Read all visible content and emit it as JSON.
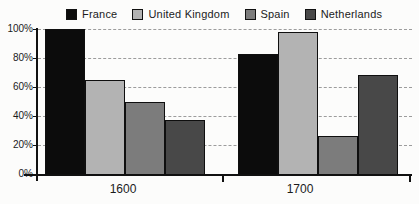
{
  "chart_data": {
    "type": "bar",
    "title": "",
    "xlabel": "",
    "ylabel": "",
    "categories": [
      "1600",
      "1700"
    ],
    "series": [
      {
        "name": "France",
        "color": "#0c0c0c",
        "values": [
          100,
          83
        ]
      },
      {
        "name": "United Kingdom",
        "color": "#b3b3b3",
        "values": [
          65,
          98
        ]
      },
      {
        "name": "Spain",
        "color": "#7c7c7c",
        "values": [
          50,
          26
        ]
      },
      {
        "name": "Netherlands",
        "color": "#484848",
        "values": [
          37,
          68
        ]
      }
    ],
    "ylim": [
      0,
      100
    ],
    "yticks": [
      {
        "value": 0,
        "label": "0%"
      },
      {
        "value": 20,
        "label": "20%"
      },
      {
        "value": 40,
        "label": "40%"
      },
      {
        "value": 60,
        "label": "60%"
      },
      {
        "value": 80,
        "label": "80%"
      },
      {
        "value": 100,
        "label": "100%"
      }
    ],
    "grid": "horizontal-dashed",
    "legend_position": "top"
  },
  "colors": {
    "background": "#fcfcfb",
    "axis": "#111111",
    "gridline": "#9c9c9c",
    "text": "#1b1b1b"
  }
}
